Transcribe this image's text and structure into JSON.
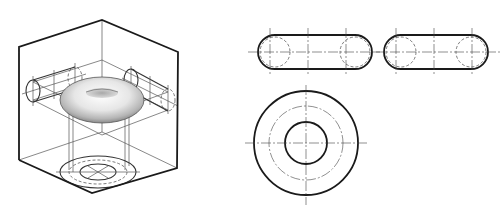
{
  "figure": {
    "isometric_view": {
      "label": "",
      "object": "torus",
      "box": "cube-projection-frame"
    },
    "orthographic_views": {
      "front_view": {
        "shape": "slot-with-rounded-ends",
        "centerlines": 3
      },
      "side_view": {
        "shape": "slot-with-rounded-ends",
        "centerlines": 3
      },
      "top_view": {
        "shape": "concentric-circles",
        "circles": [
          "outer",
          "centerline",
          "inner"
        ]
      }
    },
    "colors": {
      "line": "#1a1a1a",
      "thin_line": "#555555",
      "background": "#ffffff"
    }
  }
}
